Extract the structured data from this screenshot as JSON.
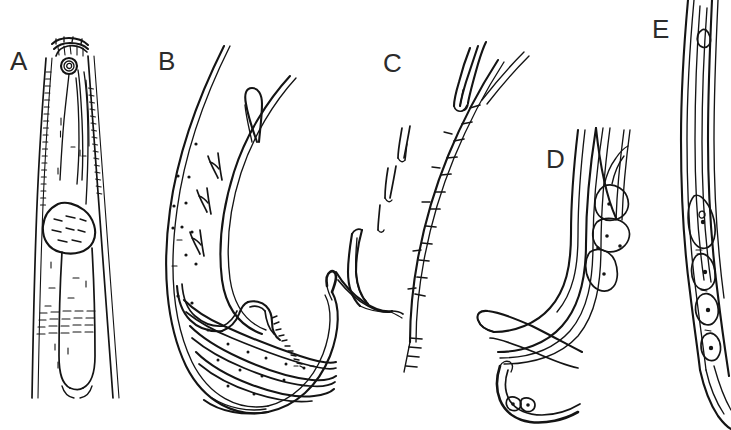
{
  "figure": {
    "kind": "scientific-line-drawing-plate",
    "background_color": "#ffffff",
    "ink_color": "#141414",
    "width": 731,
    "height": 430,
    "panel_count": 5
  },
  "panels": [
    {
      "id": "A",
      "label": "A",
      "label_x": 10,
      "label_y": 48,
      "description": "anterior end / head region with stoma, amphid ring, pharynx and median bulb",
      "features": [
        "cuticular annulation along left body margin",
        "cephalic framework at apex",
        "spiral amphid or stoma ring",
        "pharyngeal corpus",
        "ovoid median bulb with internal striations",
        "nerve ring dashes",
        "posterior pharyngeal end with rounded terminus"
      ]
    },
    {
      "id": "B",
      "label": "B",
      "label_x": 158,
      "label_y": 48,
      "description": "male posterior end, lateral view, showing bursa, genital papillae, spicules and gubernaculum",
      "features": [
        "broad curved bursal membrane",
        "two elongate papillae / setae on inner ray",
        "row of small scattered pore dots",
        "serrated gubernaculum margin",
        "paired arcuate spicules",
        "pointed bursal tip"
      ]
    },
    {
      "id": "C",
      "label": "C",
      "label_x": 383,
      "label_y": 50,
      "description": "spinous spicule shaft with barbs and detached accessory piece",
      "features": [
        "elongate spinous shaft bearing lateral barbs",
        "distal tapering tip",
        "free-standing bifid setae alongside shaft",
        "lanceolate accessory piece at mid-left",
        "basal barbs at shaft base"
      ]
    },
    {
      "id": "D",
      "label": "D",
      "label_x": 546,
      "label_y": 146,
      "description": "tail region detail with spicule, gubernaculum and subventral glandular cells",
      "features": [
        "three nested cuticular contour lines",
        "cluster of rounded glandular cells with central nuclei",
        "slender curved spicule with blunt proximal knob",
        "separate lower spicule with two nucleated cells at tip"
      ]
    },
    {
      "id": "E",
      "label": "E",
      "label_x": 652,
      "label_y": 16,
      "description": "whole tail in lateral view showing chain of nucleated cells along body axis",
      "features": [
        "long gently curved body outline",
        "elongate internal duct",
        "series of ovoid nucleated cells in a row",
        "small dark nuclei dots",
        "tapering posterior terminus"
      ]
    }
  ]
}
